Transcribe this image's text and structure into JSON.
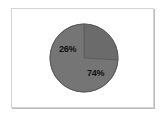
{
  "figure": {
    "background_color": "#ffffff",
    "frame_border_color": "#d4d4d4",
    "frame_shadow_color": "#bdbdbd"
  },
  "chart_data": {
    "type": "pie",
    "title": "",
    "subtitle": "",
    "xlabel": "",
    "ylabel": "",
    "categories": [
      "Slice 1",
      "Slice 2"
    ],
    "values": [
      26,
      74
    ],
    "value_unit": "%",
    "data_labels": [
      "26%",
      "74%"
    ],
    "colors": [
      "#6b6b6b",
      "#757575"
    ],
    "edge_color": "#5a5a5a",
    "start_angle_deg": 90,
    "direction": "clockwise",
    "legend": false,
    "legend_position": "none",
    "grid": false,
    "annotations": []
  }
}
